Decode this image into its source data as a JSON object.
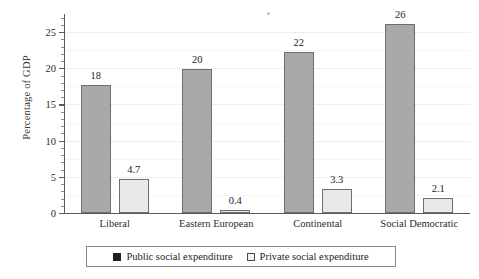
{
  "chart_data": {
    "type": "bar",
    "title": "",
    "subtitle": "",
    "xlabel": "",
    "ylabel": "Percentage of GDP",
    "ylim": [
      0,
      27.5
    ],
    "yticks": [
      0,
      5,
      10,
      15,
      20,
      25
    ],
    "ytick_labels": [
      "0",
      "5",
      "10",
      "15",
      "20",
      "25"
    ],
    "minor_ticks": true,
    "grid": "horizontal-dotted",
    "legend_position": "bottom-outside",
    "categories": [
      "Liberal",
      "Eastern European",
      "Continental",
      "Social Democratic"
    ],
    "series": [
      {
        "name": "Public social expenditure",
        "color": "#a9a9a9",
        "swatch_color": "#1f1f1f",
        "values": [
          17.7,
          19.9,
          22.2,
          26.1
        ],
        "labels": [
          "18",
          "20",
          "22",
          "26"
        ]
      },
      {
        "name": "Private social expenditure",
        "color": "#e9e9e9",
        "swatch_color": "#f2f2f2",
        "values": [
          4.7,
          0.4,
          3.3,
          2.1
        ],
        "labels": [
          "4.7",
          "0.4",
          "3.3",
          "2.1"
        ]
      }
    ]
  },
  "legend": {
    "public_label": "Public social expenditure",
    "private_label": "Private social expenditure"
  },
  "colors": {
    "public_bar": "#a9a9a9",
    "private_bar": "#e9e9e9",
    "bar_outline": "#6e6e6e",
    "axis": "#5b5b5b",
    "gridline": "#dcdcdc",
    "text": "#242424",
    "background": "#ffffff"
  }
}
